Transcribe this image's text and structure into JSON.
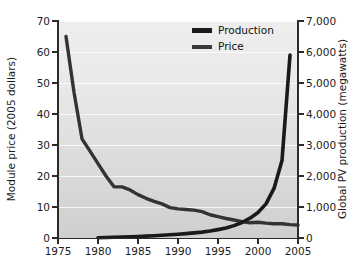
{
  "chart_data": {
    "type": "line",
    "title": "",
    "xlabel": "",
    "ylabel": "Module price (2005 dollars)",
    "ylabel_right": "Global PV production (megawatts)",
    "xlim": [
      1975,
      2005
    ],
    "ylim": [
      0,
      70
    ],
    "ylim_right": [
      0,
      7000
    ],
    "grid": true,
    "legend_position": "top-center-right",
    "xticks": [
      "1975",
      "1980",
      "1985",
      "1990",
      "1995",
      "2000",
      "2005"
    ],
    "xtick_values": [
      1975,
      1980,
      1985,
      1990,
      1995,
      2000,
      2005
    ],
    "yticks_left": [
      "0",
      "10",
      "20",
      "30",
      "40",
      "50",
      "60",
      "70"
    ],
    "ytick_values_left": [
      0,
      10,
      20,
      30,
      40,
      50,
      60,
      70
    ],
    "yticks_right": [
      "0",
      "1,000",
      "2,000",
      "3,000",
      "4,000",
      "5,000",
      "6,000",
      "7,000"
    ],
    "ytick_values_right": [
      0,
      1000,
      2000,
      3000,
      4000,
      5000,
      6000,
      7000
    ],
    "series": [
      {
        "name": "Production",
        "axis": "right",
        "units": "megawatts",
        "color": "#1a1a1a",
        "x": [
          1980,
          1981,
          1982,
          1983,
          1984,
          1985,
          1986,
          1987,
          1988,
          1989,
          1990,
          1991,
          1992,
          1993,
          1994,
          1995,
          1996,
          1997,
          1998,
          1999,
          2000,
          2001,
          2002,
          2003,
          2004
        ],
        "values": [
          10,
          15,
          22,
          30,
          40,
          50,
          60,
          75,
          90,
          105,
          120,
          140,
          165,
          190,
          225,
          270,
          320,
          400,
          500,
          640,
          820,
          1100,
          1600,
          2500,
          5900
        ]
      },
      {
        "name": "Price",
        "axis": "left",
        "units": "2005 dollars",
        "color": "#333333",
        "x": [
          1976,
          1977,
          1978,
          1979,
          1980,
          1981,
          1982,
          1983,
          1984,
          1985,
          1986,
          1987,
          1988,
          1989,
          1990,
          1991,
          1992,
          1993,
          1994,
          1995,
          1996,
          1997,
          1998,
          1999,
          2000,
          2001,
          2002,
          2003,
          2004,
          2005
        ],
        "values": [
          65.0,
          47.0,
          32.0,
          28.0,
          24.0,
          20.0,
          16.5,
          16.5,
          15.5,
          14.0,
          12.8,
          11.8,
          11.0,
          9.8,
          9.4,
          9.2,
          9.0,
          8.5,
          7.5,
          6.9,
          6.3,
          5.8,
          5.3,
          4.9,
          5.1,
          4.8,
          4.6,
          4.6,
          4.3,
          4.2
        ]
      }
    ]
  }
}
